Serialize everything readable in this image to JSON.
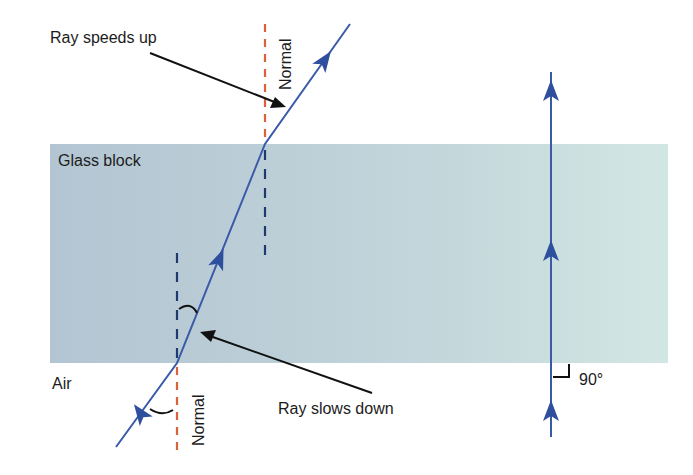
{
  "labels": {
    "ray_speeds_up": "Ray speeds up",
    "ray_slows_down": "Ray slows down",
    "glass_block": "Glass block",
    "air": "Air",
    "normal_top": "Normal",
    "normal_bottom": "Normal",
    "right_angle": "90°"
  },
  "colors": {
    "ray": "#3a5aa8",
    "arrowhead": "#2e4f9e",
    "normal_in_air": "#d9623b",
    "normal_in_glass": "#1f3a6e",
    "pointer_arrow": "#111111",
    "glass_left": "#b3c5d2",
    "glass_right": "#d2e6e3"
  },
  "geometry": {
    "glass_block": {
      "x": 50,
      "y": 144,
      "width": 618,
      "height": 219
    },
    "oblique_ray": {
      "incident": [
        [
          116,
          447
        ],
        [
          177,
          363
        ]
      ],
      "refracted": [
        [
          177,
          363
        ],
        [
          265,
          144
        ]
      ],
      "emergent": [
        [
          265,
          144
        ],
        [
          350,
          24
        ]
      ]
    },
    "normals": {
      "entry_air": {
        "x": 177,
        "y1": 363,
        "y2": 452
      },
      "entry_glass": {
        "x": 177,
        "y1": 253,
        "y2": 363
      },
      "exit_air": {
        "x": 265,
        "y1": 24,
        "y2": 144
      },
      "exit_glass": {
        "x": 265,
        "y1": 144,
        "y2": 256
      }
    },
    "vertical_ray": {
      "x": 551,
      "y1": 72,
      "y2": 437
    }
  }
}
